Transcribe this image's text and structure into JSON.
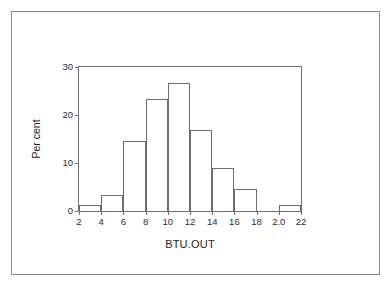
{
  "figure": {
    "background_color": "#ffffff",
    "frame_color": "#8a8a8a",
    "axis_color": "#707070",
    "bar_outline_color": "#6e6e6e"
  },
  "axes": {
    "x_title": "BTU.OUT",
    "y_title": "Per cent",
    "x_tick_labels": [
      "2",
      "4",
      "6",
      "8",
      "10",
      "12",
      "14",
      "16",
      "18",
      "2.0",
      "22"
    ],
    "y_tick_labels": [
      "0",
      "10",
      "20",
      "30"
    ]
  },
  "chart_data": {
    "type": "bar",
    "title": "",
    "subtitle": "",
    "xlabel": "BTU.OUT",
    "ylabel": "Per cent",
    "xlim": [
      2,
      22
    ],
    "ylim": [
      0,
      30
    ],
    "xticks": [
      2,
      4,
      6,
      8,
      10,
      12,
      14,
      16,
      18,
      20,
      22
    ],
    "xtick_labels": [
      "2",
      "4",
      "6",
      "8",
      "10",
      "12",
      "14",
      "16",
      "18",
      "2.0",
      "22"
    ],
    "yticks": [
      0,
      10,
      20,
      30
    ],
    "ytick_labels": [
      "0",
      "10",
      "20",
      "30"
    ],
    "grid": false,
    "legend": null,
    "bin_width": 2,
    "bin_edges": [
      2,
      4,
      6,
      8,
      10,
      12,
      14,
      16,
      18,
      20,
      22
    ],
    "categories": [
      "2-4",
      "4-6",
      "6-8",
      "8-10",
      "10-12",
      "12-14",
      "14-16",
      "16-18",
      "18-20",
      "20-22"
    ],
    "values": [
      1.2,
      3.3,
      14.6,
      23.4,
      26.7,
      16.8,
      9.0,
      4.5,
      0,
      1.2
    ],
    "series": [
      {
        "name": "Per cent",
        "values": [
          1.2,
          3.3,
          14.6,
          23.4,
          26.7,
          16.8,
          9.0,
          4.5,
          0,
          1.2
        ]
      }
    ],
    "annotations": []
  }
}
